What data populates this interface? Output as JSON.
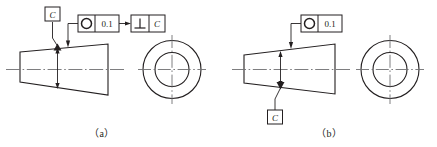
{
  "page": {
    "background_color": "#ffffff",
    "line_color": "#231f20",
    "width": 437,
    "height": 147
  },
  "figures": [
    {
      "id": "a",
      "caption": "（a）",
      "datum_label": "C",
      "datum_position": "top",
      "control_frames": [
        {
          "id": "circularity",
          "symbol_name": "circularity-icon",
          "symbol_glyph": "○",
          "tolerance": "0.1"
        },
        {
          "id": "perpendicularity",
          "symbol_name": "perpendicularity-icon",
          "symbol_glyph": "⊥",
          "datum": "C"
        }
      ],
      "shape": "truncated-cone-trapezoid",
      "end_view": "two-concentric-circles"
    },
    {
      "id": "b",
      "caption": "（b）",
      "datum_label": "C",
      "datum_position": "bottom",
      "control_frames": [
        {
          "id": "circularity",
          "symbol_name": "circularity-icon",
          "symbol_glyph": "○",
          "tolerance": "0.1"
        }
      ],
      "shape": "truncated-cone-trapezoid",
      "end_view": "two-concentric-circles"
    }
  ]
}
